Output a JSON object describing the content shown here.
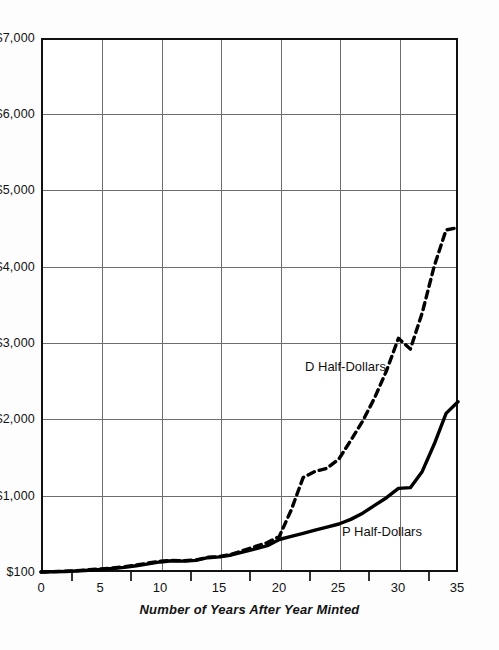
{
  "chart_data": {
    "type": "line",
    "title": "",
    "subtitle": "",
    "xlabel": "Number of Years After Year Minted",
    "ylabel": "",
    "xlim": [
      0,
      35
    ],
    "ylim": [
      100,
      7000
    ],
    "grid": true,
    "legend_position": "inline-annotations",
    "xticks": [
      "0",
      "5",
      "10",
      "15",
      "20",
      "25",
      "30",
      "35"
    ],
    "xtick_values": [
      0,
      5,
      10,
      15,
      20,
      25,
      30,
      35
    ],
    "yticks": [
      "$100",
      "$1,000",
      "$2,000",
      "$3,000",
      "$4,000",
      "$5,000",
      "$6,000",
      "$7,000"
    ],
    "ytick_values": [
      100,
      1000,
      2000,
      3000,
      4000,
      5000,
      6000,
      7000
    ],
    "minor_ticks": true,
    "annotations": [
      {
        "text": "D Half-Dollars",
        "series": "D Half-Dollars"
      },
      {
        "text": "P Half-Dollars",
        "series": "P Half-Dollars"
      }
    ],
    "series": [
      {
        "name": "D Half-Dollars",
        "style": "dashed",
        "color": "#000000",
        "x": [
          0,
          1,
          2,
          3,
          4,
          5,
          6,
          7,
          8,
          9,
          10,
          11,
          12,
          13,
          14,
          15,
          16,
          17,
          18,
          19,
          20,
          21,
          22,
          23,
          24,
          25,
          26,
          27,
          28,
          29,
          30,
          31,
          32,
          33,
          34,
          35
        ],
        "values": [
          100,
          105,
          110,
          118,
          128,
          140,
          152,
          168,
          190,
          215,
          240,
          250,
          245,
          255,
          290,
          300,
          330,
          380,
          430,
          480,
          560,
          900,
          1320,
          1400,
          1440,
          1560,
          1800,
          2050,
          2350,
          2700,
          3120,
          2980,
          3450,
          4050,
          4520,
          4550
        ]
      },
      {
        "name": "P Half-Dollars",
        "style": "solid",
        "color": "#000000",
        "x": [
          0,
          1,
          2,
          3,
          4,
          5,
          6,
          7,
          8,
          9,
          10,
          11,
          12,
          13,
          14,
          15,
          16,
          17,
          18,
          19,
          20,
          21,
          22,
          23,
          24,
          25,
          26,
          27,
          28,
          29,
          30,
          31,
          32,
          33,
          34,
          35
        ],
        "values": [
          100,
          103,
          107,
          113,
          122,
          133,
          145,
          160,
          180,
          205,
          230,
          245,
          240,
          250,
          285,
          295,
          320,
          360,
          400,
          440,
          520,
          560,
          600,
          640,
          680,
          720,
          780,
          860,
          960,
          1060,
          1180,
          1190,
          1400,
          1750,
          2150,
          2300
        ]
      }
    ]
  }
}
